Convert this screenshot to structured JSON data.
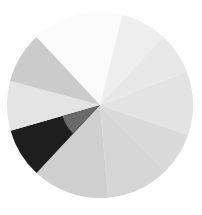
{
  "chart_data": {
    "type": "pie",
    "title": "",
    "legend": [],
    "center": [
      100,
      105
    ],
    "radius": 93,
    "start_angle_deg_clockwise_from_top": -43,
    "slices": [
      {
        "label": "",
        "value": 57,
        "color": "#fbfbfb"
      },
      {
        "label": "",
        "value": 29,
        "color": "#eeeeee"
      },
      {
        "label": "",
        "value": 26,
        "color": "#e8e8e8"
      },
      {
        "label": "",
        "value": 40,
        "color": "#e3e3e3"
      },
      {
        "label": "",
        "value": 26,
        "color": "#dadada"
      },
      {
        "label": "",
        "value": 40,
        "color": "#d6d6d6"
      },
      {
        "label": "",
        "value": 48,
        "color": "#cfcfcf"
      },
      {
        "label": "",
        "value": 31,
        "color": "#1e1e1e",
        "inner_color": "#6a6a6a"
      },
      {
        "label": "",
        "value": 31,
        "color": "#e4e4e4"
      },
      {
        "label": "",
        "value": 32,
        "color": "#cbcbcb"
      }
    ],
    "values": [
      57,
      29,
      26,
      40,
      26,
      40,
      48,
      31,
      31,
      32
    ],
    "categories": [
      "",
      "",
      "",
      "",
      "",
      "",
      "",
      "",
      "",
      ""
    ]
  }
}
